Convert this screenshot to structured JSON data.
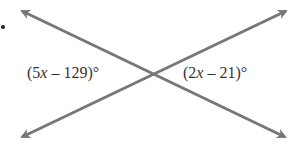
{
  "figure": {
    "type": "intersecting-lines",
    "line_color": "#777777",
    "text_color": "#333333",
    "background": "#ffffff"
  },
  "labels": {
    "left_angle": {
      "open": "(5",
      "var": "x",
      "rest": " – 129)°"
    },
    "right_angle": {
      "open": "(2",
      "var": "x",
      "rest": " – 21)°"
    }
  },
  "lines": [
    {
      "from": [
        20,
        10
      ],
      "to": [
        287,
        138
      ],
      "arrows": "both"
    },
    {
      "from": [
        20,
        138
      ],
      "to": [
        288,
        10
      ],
      "arrows": "both"
    }
  ],
  "intersection": [
    150,
    73
  ]
}
